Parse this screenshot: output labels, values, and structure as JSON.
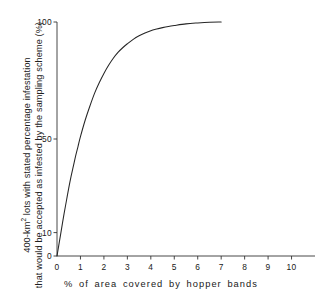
{
  "chart_data": {
    "type": "line",
    "title": "",
    "xlabel": "% of area covered by hopper bands",
    "ylabel_line1": "400-km² lots with stated percentage infestation",
    "ylabel_line2": "that would be accepted as infested by the sampling scheme (%)",
    "ylabel_line1_pre": "400-km",
    "ylabel_line1_sup": "2",
    "ylabel_line1_post": " lots with stated percentage infestation",
    "xlim": [
      0,
      11
    ],
    "ylim": [
      0,
      103
    ],
    "grid": false,
    "legend": null,
    "xticks": [
      0,
      1,
      2,
      3,
      4,
      5,
      6,
      7,
      8,
      9,
      10
    ],
    "xtick_labels": [
      "0",
      "1",
      "2",
      "3",
      "4",
      "5",
      "6",
      "7",
      "8",
      "9",
      "10"
    ],
    "yticks": [
      0,
      10,
      50,
      100
    ],
    "ytick_labels": [
      "0",
      "10",
      "50",
      "100"
    ],
    "line_color": "#262626",
    "series": [
      {
        "name": "acceptance curve",
        "x": [
          0.0,
          0.1,
          0.2,
          0.3,
          0.4,
          0.5,
          0.6,
          0.7,
          0.8,
          0.9,
          1.0,
          1.2,
          1.4,
          1.6,
          1.8,
          2.0,
          2.2,
          2.4,
          2.6,
          2.8,
          3.0,
          3.25,
          3.5,
          3.75,
          4.0,
          4.25,
          4.5,
          4.75,
          5.0,
          5.5,
          6.0,
          6.5,
          7.0
        ],
        "y": [
          0.0,
          6.0,
          12.0,
          18.0,
          23.5,
          29.0,
          34.0,
          38.5,
          43.0,
          47.0,
          51.0,
          58.0,
          64.0,
          69.5,
          74.0,
          78.0,
          81.5,
          84.5,
          87.0,
          89.0,
          90.7,
          92.6,
          94.1,
          95.3,
          96.3,
          97.0,
          97.6,
          98.1,
          98.5,
          99.2,
          99.6,
          99.9,
          100.0
        ]
      }
    ]
  },
  "axes": {
    "y_axis_name": "y-axis",
    "x_axis_name": "x-axis"
  }
}
